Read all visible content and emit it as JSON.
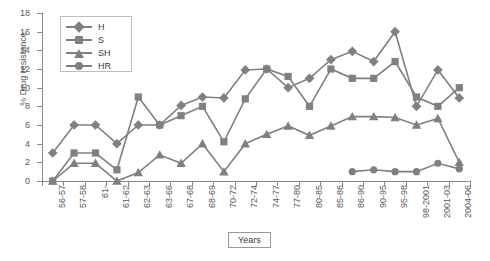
{
  "chart_data": {
    "type": "line",
    "title": "",
    "xlabel": "Years",
    "ylabel": "% Drug resistance",
    "ylim": [
      0,
      18
    ],
    "ytick_step": 2,
    "yticks": [
      0,
      2,
      4,
      6,
      8,
      10,
      12,
      14,
      16,
      18
    ],
    "grid": false,
    "legend_position": "top-left-inside",
    "categories": [
      "56-57",
      "57-58",
      "61-",
      "61-62",
      "62-63",
      "63-66",
      "67-68",
      "68-69",
      "70-72",
      "72-74",
      "74-77",
      "77-80",
      "80-85",
      "85-86",
      "86-90",
      "90-95",
      "95-98",
      "98-2001",
      "2001-03",
      "2004-06"
    ],
    "series": [
      {
        "name": "H",
        "marker": "diamond",
        "color": "#808080",
        "values": [
          3,
          6,
          6,
          4,
          6,
          6,
          8.1,
          9,
          8.9,
          11.9,
          12,
          10,
          11,
          13,
          13.9,
          12.8,
          16,
          8,
          11.9,
          8.9
        ]
      },
      {
        "name": "S",
        "marker": "square",
        "color": "#808080",
        "values": [
          0,
          3,
          3,
          1.2,
          9,
          6,
          7,
          8,
          4.2,
          8.8,
          12,
          11.2,
          8,
          12,
          11,
          11,
          12.8,
          9,
          8,
          10
        ]
      },
      {
        "name": "SH",
        "marker": "triangle",
        "color": "#808080",
        "values": [
          0,
          1.9,
          1.9,
          0,
          0.9,
          2.8,
          1.9,
          4,
          1,
          4,
          5,
          5.9,
          4.9,
          5.9,
          6.9,
          6.9,
          6.8,
          6,
          6.7,
          2
        ]
      },
      {
        "name": "HR",
        "marker": "circle",
        "color": "#808080",
        "values": [
          null,
          null,
          null,
          null,
          null,
          null,
          null,
          null,
          null,
          null,
          null,
          null,
          null,
          null,
          1,
          1.2,
          1,
          1,
          1.9,
          1.3
        ]
      }
    ]
  },
  "legend": {
    "items": [
      {
        "label": "H",
        "marker": "diamond"
      },
      {
        "label": "S",
        "marker": "square"
      },
      {
        "label": "SH",
        "marker": "triangle"
      },
      {
        "label": "HR",
        "marker": "circle"
      }
    ]
  },
  "axis": {
    "y_title": "% Drug resistance",
    "x_title_box": "Years"
  }
}
